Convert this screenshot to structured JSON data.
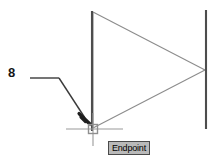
{
  "app": {
    "type": "cad-drawing-viewport",
    "background_color": "#ffffff"
  },
  "annotation": {
    "dimension_label": "8",
    "leader": {
      "name": "leader-line",
      "horizontal_start_x": 30,
      "horizontal_end_x": 59,
      "horizontal_y": 78,
      "arrow_tip_x": 89,
      "arrow_tip_y": 123,
      "color": "#3a3a3a"
    }
  },
  "geometry": {
    "left_vertical_line": {
      "x": 92,
      "y_top": 11,
      "y_bottom": 131,
      "color": "#4d4d4d",
      "width": 2
    },
    "right_vertical_line": {
      "x": 206,
      "y_top": 10,
      "y_bottom": 129,
      "color": "#4d4d4d",
      "width": 2
    },
    "triangle": {
      "top_x": 93,
      "top_y": 12,
      "apex_x": 205,
      "apex_y": 70,
      "bottom_x": 93,
      "bottom_y": 128,
      "color": "#8c8c8c",
      "width": 1
    }
  },
  "cursor": {
    "crosshair": {
      "name": "crosshair-cursor",
      "center_x": 93,
      "center_y": 129,
      "h_start_x": 66,
      "h_end_x": 123,
      "v_start_y": 113,
      "v_end_y": 146,
      "color": "#9a9a9a"
    },
    "snap_marker": {
      "name": "endpoint-snap-marker",
      "shape": "square",
      "x": 88,
      "y": 124,
      "size": 10,
      "color": "#8f8f8f"
    }
  },
  "tooltip": {
    "label": "Endpoint",
    "background_color": "#b9b9b9",
    "border_color": "#4a4a4a",
    "text_color": "#000000"
  }
}
